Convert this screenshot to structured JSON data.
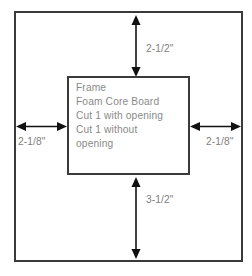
{
  "diagram": {
    "background_color": "#ffffff",
    "outline_color": "#3a3a3a",
    "text_color": "#8a8a8a",
    "arrow_color": "#111111",
    "outer_board": {
      "name": "outer-board-outline"
    },
    "inner_board": {
      "name": "inner-frame-outline",
      "lines": [
        "Frame",
        "Foam Core Board",
        "Cut 1 with opening",
        "Cut 1 without",
        "opening"
      ]
    },
    "dimensions": {
      "top": {
        "label": "2-1/2\"",
        "orientation": "vertical",
        "position": "top"
      },
      "bottom": {
        "label": "3-1/2\"",
        "orientation": "vertical",
        "position": "bottom"
      },
      "left": {
        "label": "2-1/8\"",
        "orientation": "horizontal",
        "position": "left"
      },
      "right": {
        "label": "2-1/8\"",
        "orientation": "horizontal",
        "position": "right"
      }
    }
  }
}
